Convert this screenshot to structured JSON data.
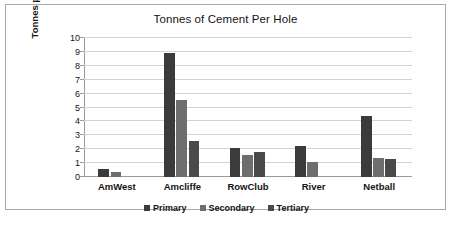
{
  "chart_data": {
    "type": "bar",
    "title": "Tonnes of Cement Per Hole",
    "xlabel": "",
    "ylabel": "Tonnes per Hole",
    "ylim": [
      0,
      10
    ],
    "ytick_labels": [
      "10",
      "9",
      "8",
      "7",
      "6",
      "5",
      "4",
      "3",
      "2",
      "1",
      "0"
    ],
    "yticks": [
      10,
      9,
      8,
      7,
      6,
      5,
      4,
      3,
      2,
      1,
      0
    ],
    "grid": true,
    "legend_position": "bottom",
    "categories": [
      "AmWest",
      "Amcliffe",
      "RowClub",
      "River",
      "Netball"
    ],
    "series": [
      {
        "name": "Primary",
        "color": "#3b3b3b",
        "values": [
          0.6,
          8.95,
          2.1,
          2.2,
          4.4
        ]
      },
      {
        "name": "Secondary",
        "color": "#6e6e6e",
        "values": [
          0.35,
          5.55,
          1.55,
          1.1,
          1.35
        ]
      },
      {
        "name": "Tertiary",
        "color": "#4a4a4a",
        "values": [
          0,
          2.6,
          1.8,
          0,
          1.3
        ]
      }
    ]
  },
  "caption": ""
}
